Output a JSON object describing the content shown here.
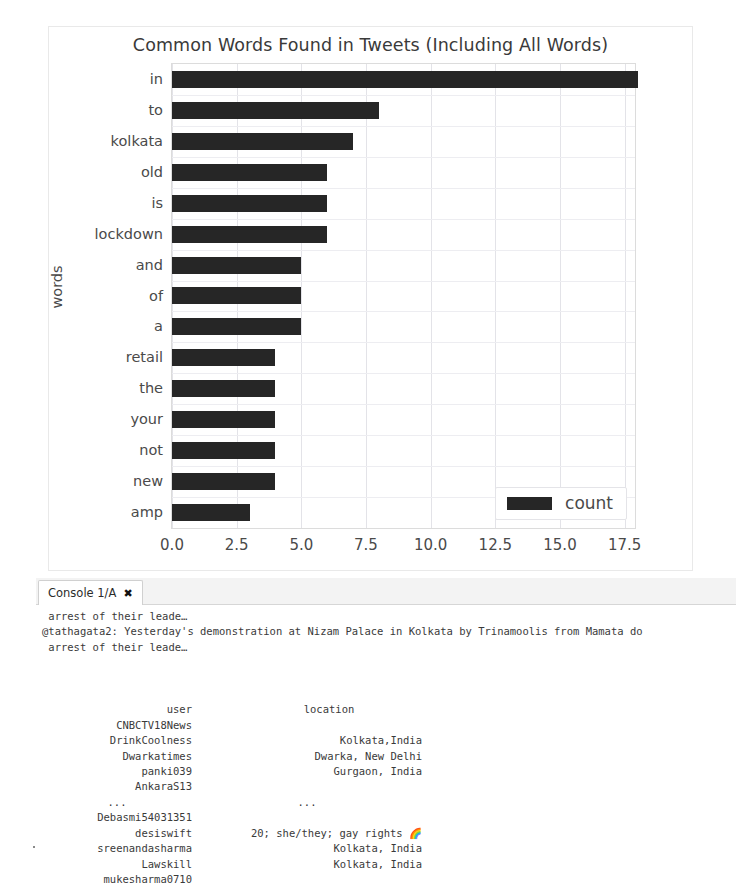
{
  "chart_data": {
    "type": "bar",
    "orientation": "horizontal",
    "title": "Common Words Found in Tweets (Including All Words)",
    "xlabel": "",
    "ylabel": "words",
    "categories": [
      "in",
      "to",
      "kolkata",
      "old",
      "is",
      "lockdown",
      "and",
      "of",
      "a",
      "retail",
      "the",
      "your",
      "not",
      "new",
      "amp"
    ],
    "values": [
      18,
      8,
      7,
      6,
      6,
      6,
      5,
      5,
      5,
      4,
      4,
      4,
      4,
      4,
      3
    ],
    "series": [
      {
        "name": "count",
        "values": [
          18,
          8,
          7,
          6,
          6,
          6,
          5,
          5,
          5,
          4,
          4,
          4,
          4,
          4,
          3
        ]
      }
    ],
    "xticks": [
      "0.0",
      "2.5",
      "5.0",
      "7.5",
      "10.0",
      "12.5",
      "15.0",
      "17.5"
    ],
    "xtick_values": [
      0,
      2.5,
      5,
      7.5,
      10,
      12.5,
      15,
      17.5
    ],
    "xlim": [
      0,
      17.9
    ],
    "grid": true,
    "legend": {
      "position": "lower-right",
      "entries": [
        "count"
      ]
    },
    "bar_color": "#262626"
  },
  "chart": {
    "title": "Common Words Found in Tweets (Including All Words)",
    "y_axis_label": "words",
    "legend_label": "count"
  },
  "console": {
    "tab_label": "Console 1/A",
    "tab_close_icon": "close-icon",
    "lines": [
      " arrest of their leade…",
      "@tathagata2: Yesterday's demonstration at Nizam Palace in Kolkata by Trinamoolis from Mamata do",
      " arrest of their leade…"
    ],
    "dataframe": {
      "columns": [
        "user",
        "location"
      ],
      "rows": [
        {
          "user": "CNBCTV18News",
          "location": ""
        },
        {
          "user": "DrinkCoolness",
          "location": "Kolkata,India"
        },
        {
          "user": "Dwarkatimes",
          "location": "Dwarka, New Delhi"
        },
        {
          "user": "panki039",
          "location": "Gurgaon, India"
        },
        {
          "user": "AnkaraS13",
          "location": ""
        },
        {
          "user": "...",
          "location": "..."
        },
        {
          "user": "Debasmi54031351",
          "location": ""
        },
        {
          "user": "desiswift",
          "location": "20; she/they; gay rights 🌈"
        },
        {
          "user": "sreenandasharma",
          "location": "Kolkata, India"
        },
        {
          "user": "Lawskill",
          "location": "Kolkata, India"
        },
        {
          "user": "mukesharma0710",
          "location": ""
        }
      ]
    }
  }
}
